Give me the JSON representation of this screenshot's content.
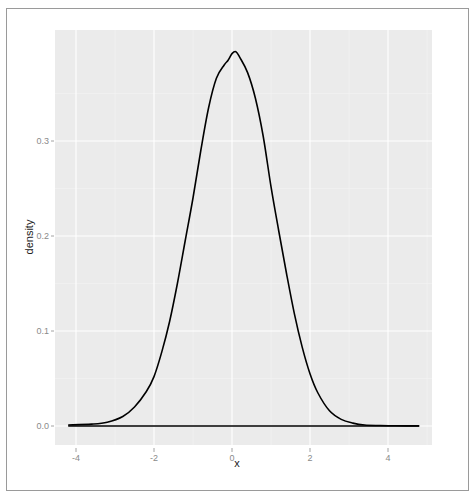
{
  "chart_data": {
    "type": "line",
    "subtype": "density",
    "title": "",
    "xlabel": "x",
    "ylabel": "density",
    "xlim": [
      -4.5,
      5.2
    ],
    "ylim": [
      -0.02,
      0.41
    ],
    "x_ticks": [
      -4,
      -2,
      0,
      2,
      4
    ],
    "x_tick_labels": [
      "-4",
      "-2",
      "0",
      "2",
      "4"
    ],
    "y_ticks": [
      0.0,
      0.1,
      0.2,
      0.3
    ],
    "y_tick_labels": [
      "0.0",
      "0.1",
      "0.2",
      "0.3"
    ],
    "grid": true,
    "legend": "none",
    "panel_background": "#ebebeb",
    "grid_color": "#ffffff",
    "line_color": "#000000",
    "series": [
      {
        "name": "density",
        "x": [
          -4.2,
          -3.6,
          -3.2,
          -2.8,
          -2.5,
          -2.2,
          -2.0,
          -1.8,
          -1.6,
          -1.4,
          -1.2,
          -1.0,
          -0.8,
          -0.6,
          -0.4,
          -0.2,
          -0.1,
          0.0,
          0.1,
          0.2,
          0.4,
          0.6,
          0.8,
          1.0,
          1.2,
          1.4,
          1.6,
          1.8,
          2.0,
          2.2,
          2.5,
          2.8,
          3.1,
          3.4,
          3.8,
          4.2,
          4.8
        ],
        "values": [
          0.001,
          0.002,
          0.004,
          0.01,
          0.02,
          0.036,
          0.052,
          0.078,
          0.11,
          0.15,
          0.195,
          0.24,
          0.29,
          0.335,
          0.366,
          0.38,
          0.385,
          0.392,
          0.394,
          0.388,
          0.372,
          0.345,
          0.305,
          0.252,
          0.205,
          0.16,
          0.118,
          0.083,
          0.055,
          0.035,
          0.016,
          0.007,
          0.003,
          0.001,
          0.0005,
          0.0002,
          0.0001
        ]
      }
    ],
    "baseline": {
      "y": 0.0,
      "x_range": [
        -4.2,
        4.8
      ]
    }
  }
}
